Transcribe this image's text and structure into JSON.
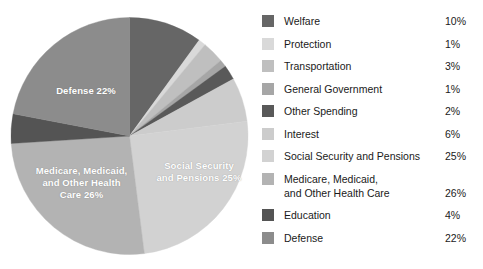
{
  "chart_data": {
    "type": "pie",
    "title": "",
    "subtitle": "",
    "xlabel": "",
    "ylabel": "",
    "legend_position": "right",
    "grid": false,
    "units": "percent",
    "start_angle_deg": 0,
    "direction": "clockwise",
    "categories": [
      "Welfare",
      "Protection",
      "Transportation",
      "General Government",
      "Other Spending",
      "Interest",
      "Social Security and Pensions",
      "Medicare, Medicaid,\nand Other Health Care",
      "Education",
      "Defense"
    ],
    "values": [
      10,
      1,
      3,
      1,
      2,
      6,
      25,
      26,
      4,
      22
    ],
    "colors": [
      "#666666",
      "#d9d9d9",
      "#bfbfbf",
      "#a6a6a6",
      "#595959",
      "#cccccc",
      "#d2d2d2",
      "#b3b3b3",
      "#545454",
      "#8c8c8c"
    ]
  },
  "pie": {
    "labels": [
      {
        "name": "defense",
        "text": "Defense 22%"
      },
      {
        "name": "medicare",
        "text": "Medicare, Medicaid,\nand Other Health\nCare 26%"
      },
      {
        "name": "social-security",
        "text": "Social Security\nand Pensions 25%"
      }
    ]
  },
  "legend": {
    "rows": [
      {
        "label": "Welfare",
        "value": "10%",
        "color": "#666666",
        "tall": false
      },
      {
        "label": "Protection",
        "value": "1%",
        "color": "#d9d9d9",
        "tall": false
      },
      {
        "label": "Transportation",
        "value": "3%",
        "color": "#bfbfbf",
        "tall": false
      },
      {
        "label": "General Government",
        "value": "1%",
        "color": "#a6a6a6",
        "tall": false
      },
      {
        "label": "Other Spending",
        "value": "2%",
        "color": "#595959",
        "tall": false
      },
      {
        "label": "Interest",
        "value": "6%",
        "color": "#cccccc",
        "tall": false
      },
      {
        "label": "Social Security and Pensions",
        "value": "25%",
        "color": "#d2d2d2",
        "tall": false
      },
      {
        "label": "Medicare, Medicaid,\nand Other Health Care",
        "value": "26%",
        "color": "#b3b3b3",
        "tall": true
      },
      {
        "label": "Education",
        "value": "4%",
        "color": "#545454",
        "tall": false
      },
      {
        "label": "Defense",
        "value": "22%",
        "color": "#8c8c8c",
        "tall": false
      }
    ]
  }
}
